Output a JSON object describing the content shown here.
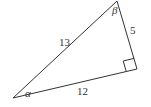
{
  "diagram": {
    "type": "right-triangle",
    "vertices": {
      "top": [
        117,
        1
      ],
      "right_angle": [
        137,
        69
      ],
      "bottom_left": [
        13,
        98
      ]
    },
    "sides": {
      "hypotenuse": "13",
      "vertical_leg": "5",
      "horizontal_leg": "12"
    },
    "angles": {
      "bottom_left": "α",
      "top": "β"
    },
    "right_angle_marker": true,
    "colors": {
      "stroke": "#333333",
      "background": "#ffffff"
    }
  }
}
